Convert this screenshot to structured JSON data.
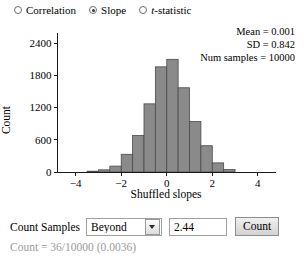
{
  "statistic_selector": {
    "options": [
      {
        "label": "Correlation",
        "selected": false,
        "italic_first_char": false
      },
      {
        "label": "Slope",
        "selected": true,
        "italic_first_char": false
      },
      {
        "label": "t-statistic",
        "selected": false,
        "italic_first_char": true
      }
    ]
  },
  "stats": {
    "mean": "Mean = 0.001",
    "sd": "SD = 0.842",
    "num_samples": "Num samples = 10000"
  },
  "controls": {
    "count_samples_label": "Count Samples",
    "direction_value": "Beyond",
    "direction_options": [
      "Beyond",
      "Below",
      "Above",
      "Between"
    ],
    "threshold_value": "2.44",
    "count_button_label": "Count",
    "result_text": "Count = 36/10000 (0.0036)"
  },
  "colors": {
    "bar_fill": "#8a8a8a",
    "bar_stroke": "#4a4a4a",
    "axis": "#1a1a1a",
    "result_text": "#9a9a9a"
  },
  "chart_data": {
    "type": "bar",
    "title": "",
    "xlabel": "Shuffled slopes",
    "ylabel": "Count",
    "xlim": [
      -4.8,
      4.8
    ],
    "ylim": [
      0,
      2600
    ],
    "xticks": [
      -4,
      -2,
      0,
      2,
      4
    ],
    "xtick_labels": [
      "−4",
      "−2",
      "0",
      "2",
      "4"
    ],
    "yticks": [
      0,
      600,
      1200,
      1800,
      2400
    ],
    "ytick_labels": [
      "0",
      "600",
      "1200",
      "1800",
      "2400"
    ],
    "grid": false,
    "legend": false,
    "bin_width": 0.5,
    "bin_centers": [
      -3.25,
      -2.75,
      -2.25,
      -1.75,
      -1.25,
      -0.75,
      -0.25,
      0.25,
      0.75,
      1.25,
      1.75,
      2.25,
      2.75
    ],
    "values": [
      15,
      40,
      110,
      330,
      680,
      1270,
      1960,
      2100,
      1570,
      940,
      490,
      170,
      45
    ]
  }
}
